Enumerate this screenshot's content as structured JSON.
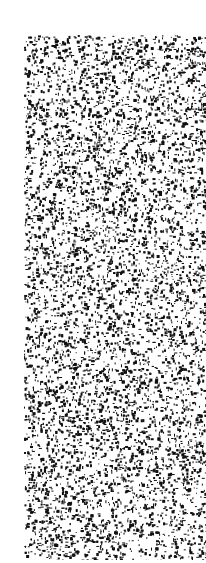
{
  "image": {
    "description": "black and white stipple / speckle noise texture",
    "background": "#ffffff",
    "ink": "#111111",
    "region": {
      "x": 24,
      "y": 35,
      "width": 182,
      "height": 525
    },
    "density": 0.34
  }
}
